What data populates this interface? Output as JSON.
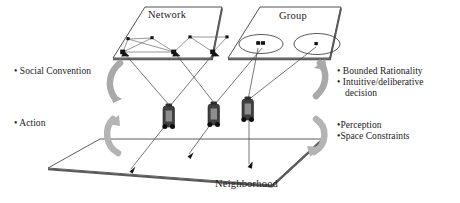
{
  "figure": {
    "type": "layered-architecture-diagram",
    "planes": [
      {
        "id": "network",
        "title": "Network"
      },
      {
        "id": "group",
        "title": "Group"
      },
      {
        "id": "neighborhood",
        "title": "Neighborhood"
      }
    ],
    "left_labels": [
      {
        "id": "social-convention",
        "text": "• Social Convention"
      },
      {
        "id": "action",
        "text": "• Action"
      }
    ],
    "right_labels": [
      {
        "id": "bounded-rationality",
        "text": "• Bounded Rationality"
      },
      {
        "id": "intuitive-decision",
        "text": "• Intuitive/deliberative",
        "continuation": "decision"
      },
      {
        "id": "perception",
        "text": "•Perception"
      },
      {
        "id": "space-constraints",
        "text": "•Space Constraints"
      }
    ],
    "agents": [
      {
        "id": "agent-1"
      },
      {
        "id": "agent-2"
      },
      {
        "id": "agent-3"
      }
    ],
    "colors": {
      "plane_stroke": "#3d3d3d",
      "plane_fill": "#ffffff",
      "plane_shadow": "#5a5a5a",
      "link_line": "#4a4a4a",
      "node_fill": "#111111",
      "agent_body": "#3f3f3f",
      "agent_panel": "#8f8f8f",
      "agent_wheel": "#0d0d0d",
      "feedback_arrow": "#a6a6a6",
      "text": "#1a1a1a"
    }
  },
  "network_plane": {
    "title": "Network",
    "nodes": [
      {
        "id": "n1",
        "x": 123,
        "y": 52,
        "type": "agent-anchor"
      },
      {
        "id": "n2",
        "x": 128,
        "y": 39,
        "type": "plain"
      },
      {
        "id": "n3",
        "x": 152,
        "y": 38,
        "type": "plain"
      },
      {
        "id": "n4",
        "x": 174,
        "y": 52,
        "type": "agent-anchor"
      },
      {
        "id": "n5",
        "x": 190,
        "y": 37,
        "type": "plain"
      },
      {
        "id": "n6",
        "x": 227,
        "y": 37,
        "type": "plain"
      },
      {
        "id": "n7",
        "x": 213,
        "y": 52,
        "type": "agent-anchor"
      }
    ],
    "edges": [
      [
        "n1",
        "n2"
      ],
      [
        "n1",
        "n3"
      ],
      [
        "n2",
        "n3"
      ],
      [
        "n2",
        "n4"
      ],
      [
        "n3",
        "n4"
      ],
      [
        "n1",
        "n4"
      ],
      [
        "n4",
        "n5"
      ],
      [
        "n5",
        "n6"
      ],
      [
        "n5",
        "n7"
      ],
      [
        "n6",
        "n7"
      ]
    ]
  },
  "group_plane": {
    "title": "Group",
    "ellipses": [
      {
        "id": "g1",
        "cx": 261,
        "cy": 44,
        "rx": 22,
        "ry": 10,
        "members": 2
      },
      {
        "id": "g2",
        "cx": 317,
        "cy": 44,
        "rx": 23,
        "ry": 11,
        "members": 1
      }
    ],
    "member_dots": [
      {
        "id": "gd1",
        "x": 258,
        "y": 43
      },
      {
        "id": "gd2",
        "x": 263,
        "y": 43
      },
      {
        "id": "gd3",
        "x": 316,
        "y": 44
      }
    ]
  },
  "neighborhood_plane": {
    "title": "Neighborhood",
    "arrow_targets": [
      {
        "id": "t1",
        "x": 130,
        "y": 170
      },
      {
        "id": "t2",
        "x": 188,
        "y": 155
      },
      {
        "id": "t3",
        "x": 248,
        "y": 165
      }
    ]
  },
  "feedback_arrows": [
    {
      "id": "left-upper",
      "side": "left",
      "direction": "down"
    },
    {
      "id": "left-lower",
      "side": "left",
      "direction": "up"
    },
    {
      "id": "right-upper",
      "side": "right",
      "direction": "up"
    },
    {
      "id": "right-lower",
      "side": "right",
      "direction": "down"
    }
  ]
}
